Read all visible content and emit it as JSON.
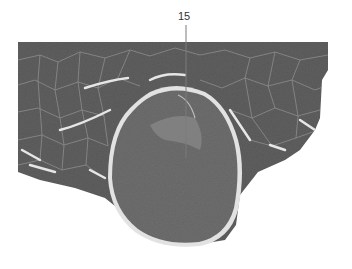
{
  "figure": {
    "labels": [
      {
        "id": "label-15",
        "text": "15",
        "x": 180,
        "y": 13
      }
    ],
    "colors": {
      "background": "#ffffff",
      "muscle_tissue": "#5f5f5f",
      "dense_region": "#6e6e6e",
      "connective_tissue": "#d8d8d8",
      "label_text": "#333333"
    }
  }
}
